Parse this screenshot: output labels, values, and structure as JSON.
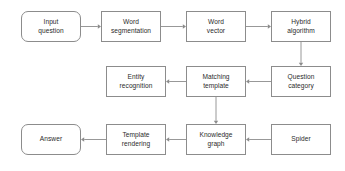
{
  "diagram": {
    "background_color": "#ffffff",
    "box_border_color": "#8c8c8c",
    "arrow_color": "#8c8c8c",
    "text_color": "#2b2b2b",
    "nodes": [
      {
        "id": "input-question",
        "label": "Input\nquestion",
        "shape": "rounded-rectangle",
        "x": 21,
        "y": 11,
        "w": 60,
        "h": 31
      },
      {
        "id": "word-segmentation",
        "label": "Word\nsegmentation",
        "shape": "rectangle",
        "x": 101,
        "y": 11,
        "w": 60,
        "h": 31
      },
      {
        "id": "word-vector",
        "label": "Word\nvector",
        "shape": "rectangle",
        "x": 186,
        "y": 11,
        "w": 60,
        "h": 31
      },
      {
        "id": "hybrid-algorithm",
        "label": "Hybrid\nalgorithm",
        "shape": "rectangle",
        "x": 271,
        "y": 11,
        "w": 60,
        "h": 31
      },
      {
        "id": "question-category",
        "label": "Question\ncategory",
        "shape": "rectangle",
        "x": 271,
        "y": 66,
        "w": 60,
        "h": 31
      },
      {
        "id": "matching-template",
        "label": "Matching\ntemplate",
        "shape": "rectangle",
        "x": 186,
        "y": 66,
        "w": 60,
        "h": 31
      },
      {
        "id": "entity-recognition",
        "label": "Entity\nrecognition",
        "shape": "rectangle",
        "x": 106,
        "y": 66,
        "w": 60,
        "h": 31
      },
      {
        "id": "spider",
        "label": "Spider",
        "shape": "rectangle",
        "x": 271,
        "y": 124,
        "w": 60,
        "h": 31
      },
      {
        "id": "knowledge-graph",
        "label": "Knowledge\ngraph",
        "shape": "rectangle",
        "x": 186,
        "y": 124,
        "w": 60,
        "h": 31
      },
      {
        "id": "template-rendering",
        "label": "Template\nrendering",
        "shape": "rectangle",
        "x": 106,
        "y": 124,
        "w": 60,
        "h": 31
      },
      {
        "id": "answer",
        "label": "Answer",
        "shape": "rounded-rectangle",
        "x": 21,
        "y": 124,
        "w": 60,
        "h": 31
      }
    ],
    "edges": [
      {
        "id": "e1",
        "from": "input-question",
        "to": "word-segmentation",
        "direction": "right"
      },
      {
        "id": "e2",
        "from": "word-segmentation",
        "to": "word-vector",
        "direction": "right"
      },
      {
        "id": "e3",
        "from": "word-vector",
        "to": "hybrid-algorithm",
        "direction": "right"
      },
      {
        "id": "e4",
        "from": "hybrid-algorithm",
        "to": "question-category",
        "direction": "down"
      },
      {
        "id": "e5",
        "from": "question-category",
        "to": "matching-template",
        "direction": "left"
      },
      {
        "id": "e6",
        "from": "matching-template",
        "to": "entity-recognition",
        "direction": "left"
      },
      {
        "id": "e7",
        "from": "matching-template",
        "to": "knowledge-graph",
        "direction": "down"
      },
      {
        "id": "e8",
        "from": "spider",
        "to": "knowledge-graph",
        "direction": "left"
      },
      {
        "id": "e9",
        "from": "knowledge-graph",
        "to": "template-rendering",
        "direction": "left"
      },
      {
        "id": "e10",
        "from": "template-rendering",
        "to": "answer",
        "direction": "left"
      }
    ]
  }
}
